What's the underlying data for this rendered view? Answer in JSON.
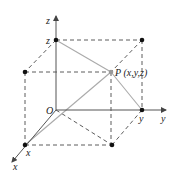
{
  "diagram": {
    "type": "3d-coordinate-box",
    "colors": {
      "axis": "#555555",
      "solid_line": "#aaaaaa",
      "dashed_line": "#333333",
      "point": "#111111",
      "point_p": "#999999"
    },
    "axes": {
      "x_label": "x",
      "y_label": "y",
      "z_label": "z"
    },
    "origin_label": "O",
    "points": {
      "x_point_label": "x",
      "y_point_label": "y",
      "z_point_label": "z",
      "p_label": "P (x,y,z)"
    }
  }
}
